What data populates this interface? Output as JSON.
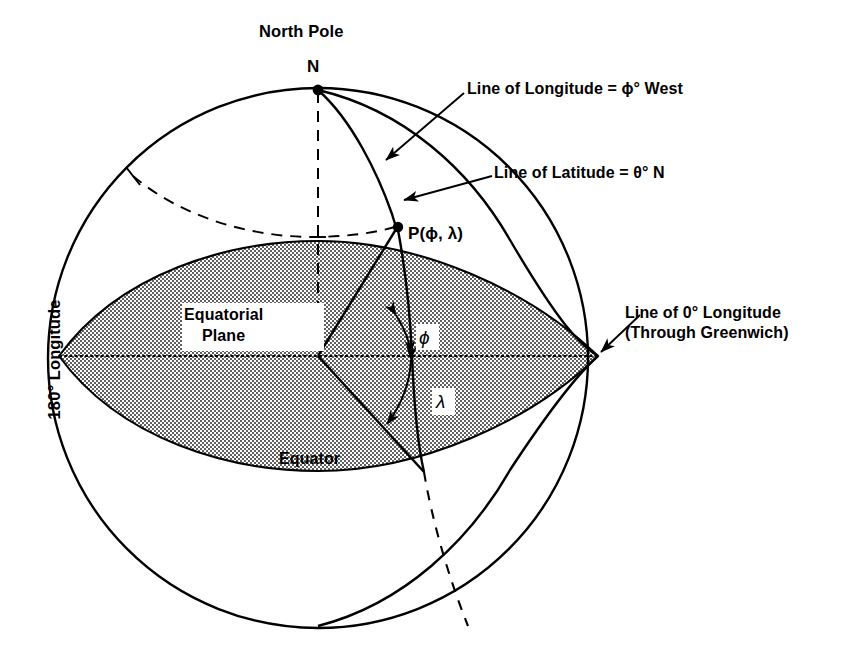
{
  "figure": {
    "kind": "geographic-coordinate-sphere-diagram",
    "background_color": "#ffffff",
    "line_color": "#000000",
    "shade_fill_color": "#d9d9d9"
  },
  "labels": {
    "north_pole": "North Pole",
    "north_pole_point": "N",
    "longitude_line": "Line of Longitude = ϕ° West",
    "latitude_line": "Line of Latitude = θ° N",
    "zero_longitude_line1": "Line of 0° Longitude",
    "zero_longitude_line2": "(Through Greenwich)",
    "point_p": "P(ϕ, λ)",
    "equatorial_plane_line1": "Equatorial",
    "equatorial_plane_line2": "Plane",
    "equator": "Equator",
    "longitude_180": "180° Longitude",
    "angle_phi": "ϕ",
    "angle_lambda": "λ"
  },
  "geometry": {
    "sphere_center_x": 318,
    "sphere_center_y": 358,
    "sphere_radius": 270,
    "north_pole_x": 318,
    "north_pole_y": 88,
    "point_p_x": 398,
    "point_p_y": 226,
    "equator_left_x": 59,
    "equator_right_x": 598,
    "equator_y": 356,
    "equatorial_plane_ry": 83
  },
  "icons": {
    "pole_marker": "filled-dot",
    "point_marker": "filled-dot",
    "leader_arrow": "arrowhead",
    "angle_arrow": "double-headed-arc-arrow"
  }
}
